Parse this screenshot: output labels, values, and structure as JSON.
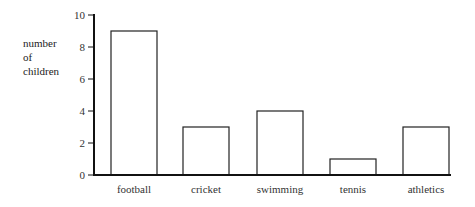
{
  "chart_data": {
    "type": "bar",
    "title": "",
    "xlabel": "",
    "ylabel": [
      "number",
      "of",
      "children"
    ],
    "categories": [
      "football",
      "cricket",
      "swimming",
      "tennis",
      "athletics"
    ],
    "values": [
      9,
      3,
      4,
      1,
      3
    ],
    "ylim": [
      0,
      10
    ],
    "yticks": [
      0,
      2,
      4,
      6,
      8,
      10
    ],
    "grid": false,
    "legend": "none",
    "colors": {
      "bar_fill": "#ffffff",
      "bar_stroke": "#222222",
      "axis": "#111111"
    }
  }
}
